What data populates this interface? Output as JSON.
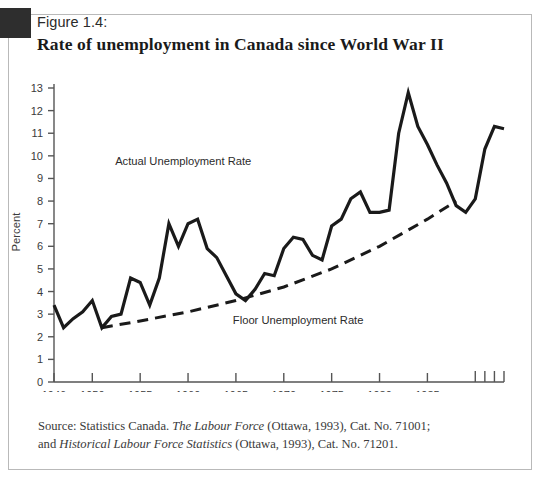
{
  "figure": {
    "label": "Figure 1.4:",
    "title": "Rate of unemployment in Canada since World War II",
    "corner_marker": "dark-square-marker"
  },
  "caption": {
    "line1_a": "Source: Statistics Canada. ",
    "line1_i": "The Labour Force",
    "line1_b": " (Ottawa, 1993), Cat. No. 71001;",
    "line2_a": "and ",
    "line2_i": "Historical Labour Force Statistics",
    "line2_b": " (Ottawa, 1993), Cat. No. 71201."
  },
  "colors": {
    "ink": "#1a1a1a",
    "axis": "#555555",
    "frame": "#b9b9b9",
    "text": "#3a3a3a"
  },
  "chart_data": {
    "type": "line",
    "title": "Rate of unemployment in Canada since World War II",
    "xlabel": "",
    "ylabel": "Percent",
    "xlim": [
      1946,
      1993
    ],
    "ylim": [
      0,
      13
    ],
    "grid": false,
    "legend": "inline-annotations",
    "ytick_labels": [
      "0",
      "1",
      "2",
      "3",
      "4",
      "5",
      "6",
      "7",
      "8",
      "9",
      "10",
      "11",
      "12",
      "13"
    ],
    "ytick_values": [
      0,
      1,
      2,
      3,
      4,
      5,
      6,
      7,
      8,
      9,
      10,
      11,
      12,
      13
    ],
    "xtick_labels": [
      "1946",
      "1950",
      "1955",
      "1960",
      "1965",
      "1970",
      "1975",
      "1980",
      "1985",
      "90",
      "91",
      "92",
      "93"
    ],
    "xtick_values": [
      1946,
      1950,
      1955,
      1960,
      1965,
      1970,
      1975,
      1980,
      1985,
      1990,
      1991,
      1992,
      1993
    ],
    "annotations": [
      {
        "text": "Actual Unemployment Rate",
        "x": 1959.5,
        "y": 9.6
      },
      {
        "text": "Floor Unemployment Rate",
        "x": 1971.5,
        "y": 2.55
      }
    ],
    "series": [
      {
        "name": "Actual Unemployment Rate",
        "style": "solid",
        "x": [
          1946,
          1947,
          1948,
          1949,
          1950,
          1951,
          1952,
          1953,
          1954,
          1955,
          1956,
          1957,
          1958,
          1959,
          1960,
          1961,
          1962,
          1963,
          1964,
          1965,
          1966,
          1967,
          1968,
          1969,
          1970,
          1971,
          1972,
          1973,
          1974,
          1975,
          1976,
          1977,
          1978,
          1979,
          1980,
          1981,
          1982,
          1983,
          1984,
          1985,
          1986,
          1987,
          1988,
          1989,
          1990,
          1991,
          1992,
          1993
        ],
        "values": [
          3.4,
          2.4,
          2.8,
          3.1,
          3.6,
          2.4,
          2.9,
          3.0,
          4.6,
          4.4,
          3.4,
          4.6,
          7.0,
          6.0,
          7.0,
          7.2,
          5.9,
          5.5,
          4.7,
          3.9,
          3.6,
          4.1,
          4.8,
          4.7,
          5.9,
          6.4,
          6.3,
          5.6,
          5.4,
          6.9,
          7.2,
          8.1,
          8.4,
          7.5,
          7.5,
          7.6,
          11.0,
          12.8,
          11.3,
          10.5,
          9.6,
          8.8,
          7.8,
          7.5,
          8.1,
          10.3,
          11.3,
          11.2
        ]
      },
      {
        "name": "Floor Unemployment Rate",
        "style": "dashed",
        "x": [
          1951,
          1955,
          1960,
          1965,
          1970,
          1975,
          1980,
          1985,
          1988
        ],
        "values": [
          2.4,
          2.7,
          3.1,
          3.6,
          4.2,
          5.0,
          6.0,
          7.2,
          8.0
        ]
      }
    ]
  }
}
